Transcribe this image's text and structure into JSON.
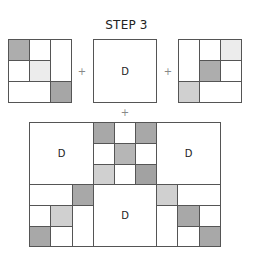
{
  "title": "STEP 3",
  "operators": {
    "plus_1": "+",
    "plus_2": "+",
    "plus_3": "+"
  },
  "colors": {
    "dark": "#aaaaaa",
    "medium": "#b6b6b6",
    "light": "#d0d0d0",
    "very_light": "#ececec",
    "white": "#ffffff",
    "border": "#555555"
  },
  "top_row": {
    "left_block": {
      "description": "3x3 pieced block",
      "cells": [
        {
          "row": 0,
          "col": 0,
          "shade": "dark"
        },
        {
          "row": 0,
          "col": 1,
          "shade": "white"
        },
        {
          "row": 0,
          "col": 2,
          "rowspan": 2,
          "shade": "white"
        },
        {
          "row": 1,
          "col": 0,
          "shade": "white"
        },
        {
          "row": 1,
          "col": 1,
          "shade": "very_light"
        },
        {
          "row": 2,
          "col": 0,
          "colspan": 2,
          "shade": "white"
        },
        {
          "row": 2,
          "col": 2,
          "shade": "dark"
        }
      ]
    },
    "middle_block": {
      "label": "D"
    },
    "right_block": {
      "description": "3x3 pieced block",
      "cells": [
        {
          "row": 0,
          "col": 0,
          "rowspan": 2,
          "shade": "white"
        },
        {
          "row": 0,
          "col": 1,
          "shade": "white"
        },
        {
          "row": 0,
          "col": 2,
          "shade": "very_light"
        },
        {
          "row": 1,
          "col": 1,
          "shade": "dark"
        },
        {
          "row": 1,
          "col": 2,
          "shade": "white"
        },
        {
          "row": 2,
          "col": 0,
          "shade": "light"
        },
        {
          "row": 2,
          "col": 1,
          "colspan": 2,
          "shade": "white"
        }
      ]
    }
  },
  "assembled": {
    "labels": {
      "top_left": "D",
      "top_right": "D",
      "bottom_center": "D"
    }
  }
}
